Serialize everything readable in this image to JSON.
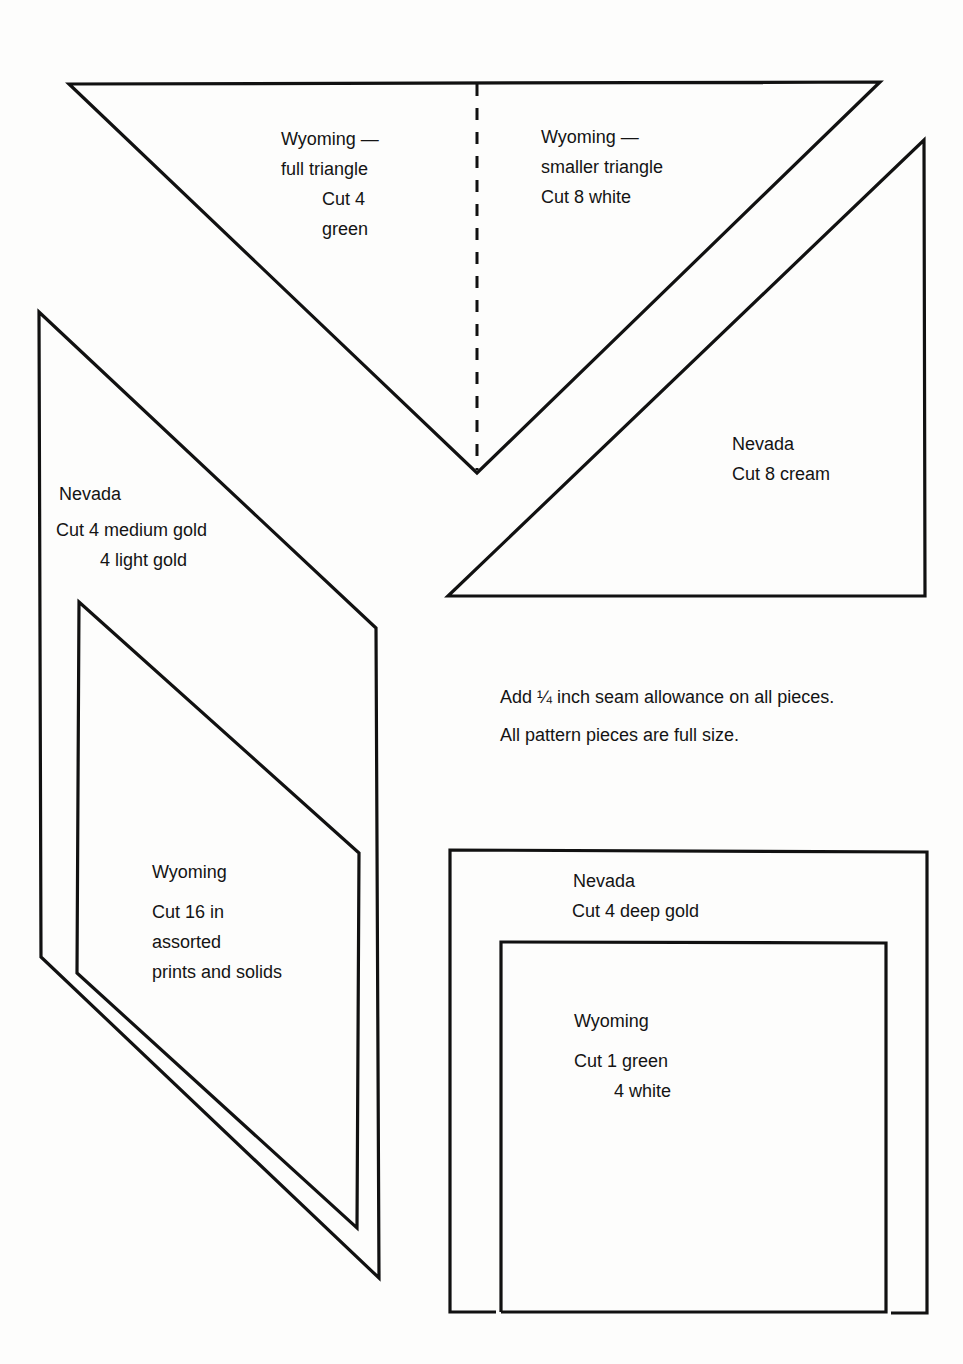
{
  "page": {
    "ink_color": "#111111",
    "paper_color": "#fdfdfc"
  },
  "pieces": {
    "wyoming_full_triangle": {
      "line1": "Wyoming —",
      "line2": "full triangle",
      "line3": "Cut 4",
      "line4": "green"
    },
    "wyoming_smaller_triangle": {
      "line1": "Wyoming —",
      "line2": "smaller triangle",
      "line3": "Cut 8 white"
    },
    "nevada_triangle": {
      "line1": "Nevada",
      "line2": "Cut 8 cream"
    },
    "nevada_parallelogram": {
      "line1": "Nevada",
      "line2": "Cut 4 medium gold",
      "line3": "4 light gold"
    },
    "wyoming_parallelogram": {
      "line1": "Wyoming",
      "line2": "Cut 16 in",
      "line3": "assorted",
      "line4": "prints and solids"
    },
    "nevada_square": {
      "line1": "Nevada",
      "line2": "Cut 4 deep gold"
    },
    "wyoming_square": {
      "line1": "Wyoming",
      "line2": "Cut 1 green",
      "line3": "4 white"
    }
  },
  "notes": {
    "seam": "Add ¼ inch seam allowance on all pieces.",
    "size": "All pattern pieces are full size."
  }
}
